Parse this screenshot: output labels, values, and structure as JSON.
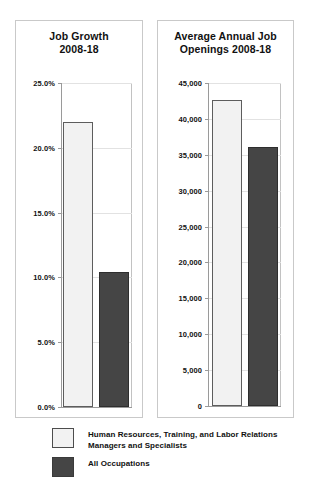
{
  "chart_data": [
    {
      "type": "bar",
      "id": "job-growth",
      "title_line1": "Job Growth",
      "title_line2": "2008-18",
      "xlabel": "",
      "ylabel": "",
      "ylim": [
        0,
        25
      ],
      "ytick_labels": [
        "25.0%",
        "20.0%",
        "15.0%",
        "10.0%",
        "5.0%",
        "0.0%"
      ],
      "ytick_values": [
        25,
        20,
        15,
        10,
        5,
        0
      ],
      "grid": true,
      "legend_position": "bottom",
      "categories": [
        "Human Resources, Training, and Labor Relations Managers and Specialists",
        "All Occupations"
      ],
      "values": [
        22.0,
        10.4
      ],
      "value_labels": [
        "22.0%",
        "10.4%"
      ]
    },
    {
      "type": "bar",
      "id": "job-openings",
      "title_line1": "Average Annual Job",
      "title_line2": "Openings 2008-18",
      "xlabel": "",
      "ylabel": "",
      "ylim": [
        0,
        45000
      ],
      "ytick_labels": [
        "45,000",
        "40,000",
        "35,000",
        "30,000",
        "25,000",
        "20,000",
        "15,000",
        "10,000",
        "5,000",
        "0"
      ],
      "ytick_values": [
        45000,
        40000,
        35000,
        30000,
        25000,
        20000,
        15000,
        10000,
        5000,
        0
      ],
      "grid": true,
      "legend_position": "bottom",
      "categories": [
        "Human Resources, Training, and Labor Relations Managers and Specialists",
        "All Occupations"
      ],
      "values": [
        42700,
        36100
      ],
      "value_labels": [
        "42,700",
        "36,100"
      ]
    }
  ],
  "charts": {
    "growth": {
      "title_line1": "Job Growth",
      "title_line2": "2008-18",
      "ticks": [
        {
          "label": "25.0%"
        },
        {
          "label": "20.0%"
        },
        {
          "label": "15.0%"
        },
        {
          "label": "10.0%"
        },
        {
          "label": "5.0%"
        },
        {
          "label": "0.0%"
        }
      ]
    },
    "openings": {
      "title_line1": "Average Annual Job",
      "title_line2": "Openings 2008-18",
      "ticks": [
        {
          "label": "45,000"
        },
        {
          "label": "40,000"
        },
        {
          "label": "35,000"
        },
        {
          "label": "30,000"
        },
        {
          "label": "25,000"
        },
        {
          "label": "20,000"
        },
        {
          "label": "15,000"
        },
        {
          "label": "10,000"
        },
        {
          "label": "5,000"
        },
        {
          "label": "0"
        }
      ]
    }
  },
  "legend": {
    "items": [
      {
        "swatch": "light",
        "color": "#f2f2f2",
        "label_line1": "Human Resources, Training, and Labor Relations",
        "label_line2": "Managers and Specialists"
      },
      {
        "swatch": "dark",
        "color": "#454545",
        "label_line1": "All Occupations",
        "label_line2": ""
      }
    ]
  },
  "colors": {
    "series_light": "#f2f2f2",
    "series_dark": "#454545",
    "panel_border": "#c9c9c9",
    "axis": "#9a9a9a",
    "gridline": "#e2e2e2",
    "text": "#111111",
    "background": "#ffffff"
  }
}
